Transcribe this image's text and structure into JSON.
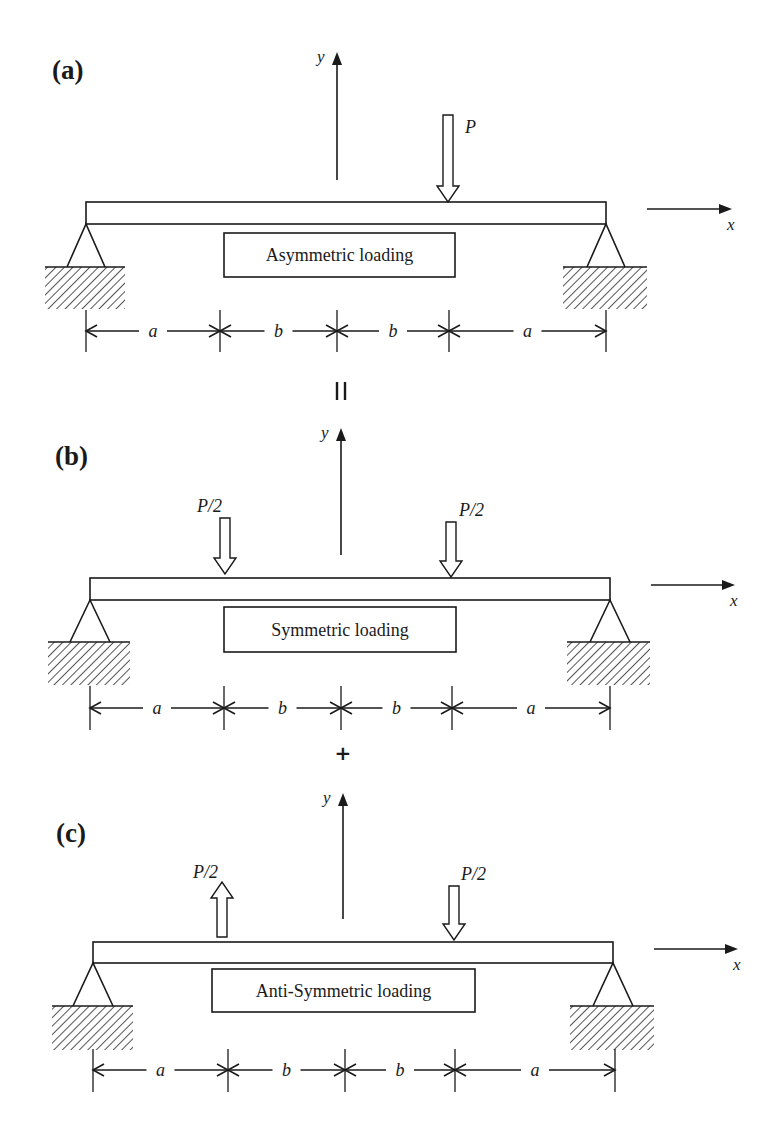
{
  "figure": {
    "width": 783,
    "height": 1136,
    "colors": {
      "ink": "#1a1a1a",
      "background": "#ffffff",
      "hatch": "#555555"
    }
  },
  "operators": [
    {
      "symbol": "=",
      "x": 341,
      "y": 392,
      "rotated": true
    },
    {
      "symbol": "+",
      "x": 343,
      "y": 760,
      "rotated": false
    }
  ],
  "panels": [
    {
      "id": "a",
      "label": "(a)",
      "label_pos": [
        52,
        79
      ],
      "title": "Asymmetric loading",
      "beam": {
        "x1": 86,
        "x2": 606,
        "top": 202,
        "bottom": 224
      },
      "title_box": {
        "x": 224,
        "y": 233,
        "w": 231,
        "h": 44
      },
      "y_axis": {
        "x": 337,
        "y_bottom": 180,
        "y_top": 52,
        "label": "y"
      },
      "x_axis": {
        "x1": 647,
        "x2": 732,
        "y": 209,
        "label": "x"
      },
      "supports": [
        {
          "apex_x": 86,
          "apex_y": 224,
          "base_y": 267,
          "half_w": 19,
          "hatch_x1": 45,
          "hatch_x2": 125,
          "hatch_h": 42
        },
        {
          "apex_x": 606,
          "apex_y": 224,
          "base_y": 267,
          "half_w": 19,
          "hatch_x1": 563,
          "hatch_x2": 647,
          "hatch_h": 42
        }
      ],
      "loads": [
        {
          "label": "P",
          "x": 448,
          "direction": "down",
          "tip_y": 202,
          "tail_y": 115,
          "label_dx": 17,
          "label_y": 133
        }
      ],
      "dimension": {
        "y": 331,
        "tick_top": 310,
        "tick_bottom": 352,
        "ticks": [
          86,
          220,
          337,
          449,
          606
        ],
        "segments": [
          "a",
          "b",
          "b",
          "a"
        ]
      }
    },
    {
      "id": "b",
      "label": "(b)",
      "label_pos": [
        55,
        465
      ],
      "title": "Symmetric loading",
      "beam": {
        "x1": 90,
        "x2": 610,
        "top": 578,
        "bottom": 600
      },
      "title_box": {
        "x": 224,
        "y": 607,
        "w": 232,
        "h": 45
      },
      "y_axis": {
        "x": 341,
        "y_bottom": 555,
        "y_top": 428,
        "label": "y"
      },
      "x_axis": {
        "x1": 651,
        "x2": 735,
        "y": 585,
        "label": "x"
      },
      "supports": [
        {
          "apex_x": 90,
          "apex_y": 600,
          "base_y": 642,
          "half_w": 20,
          "hatch_x1": 48,
          "hatch_x2": 130,
          "hatch_h": 43
        },
        {
          "apex_x": 610,
          "apex_y": 600,
          "base_y": 642,
          "half_w": 20,
          "hatch_x1": 567,
          "hatch_x2": 650,
          "hatch_h": 43
        }
      ],
      "loads": [
        {
          "label": "P/2",
          "x": 225,
          "direction": "down",
          "tip_y": 574,
          "tail_y": 518,
          "label_dx": -28,
          "label_y": 512
        },
        {
          "label": "P/2",
          "x": 451,
          "direction": "down",
          "tip_y": 577,
          "tail_y": 522,
          "label_dx": 8,
          "label_y": 516
        }
      ],
      "dimension": {
        "y": 708,
        "tick_top": 686,
        "tick_bottom": 730,
        "ticks": [
          90,
          224,
          341,
          452,
          610
        ],
        "segments": [
          "a",
          "b",
          "b",
          "a"
        ]
      }
    },
    {
      "id": "c",
      "label": "(c)",
      "label_pos": [
        56,
        842
      ],
      "title": "Anti-Symmetric loading",
      "beam": {
        "x1": 93,
        "x2": 613,
        "top": 942,
        "bottom": 963
      },
      "title_box": {
        "x": 212,
        "y": 969,
        "w": 263,
        "h": 43
      },
      "y_axis": {
        "x": 343,
        "y_bottom": 919,
        "y_top": 793,
        "label": "y"
      },
      "x_axis": {
        "x1": 654,
        "x2": 738,
        "y": 949,
        "label": "x"
      },
      "supports": [
        {
          "apex_x": 93,
          "apex_y": 963,
          "base_y": 1006,
          "half_w": 20,
          "hatch_x1": 52,
          "hatch_x2": 133,
          "hatch_h": 44
        },
        {
          "apex_x": 613,
          "apex_y": 963,
          "base_y": 1006,
          "half_w": 20,
          "hatch_x1": 570,
          "hatch_x2": 654,
          "hatch_h": 44
        }
      ],
      "loads": [
        {
          "label": "P/2",
          "x": 222,
          "direction": "up",
          "tip_y": 882,
          "tail_y": 937,
          "label_dx": -29,
          "label_y": 878
        },
        {
          "label": "P/2",
          "x": 454,
          "direction": "down",
          "tip_y": 940,
          "tail_y": 886,
          "label_dx": 7,
          "label_y": 880
        }
      ],
      "dimension": {
        "y": 1070,
        "tick_top": 1049,
        "tick_bottom": 1092,
        "ticks": [
          93,
          228,
          345,
          455,
          615
        ],
        "segments": [
          "a",
          "b",
          "b",
          "a"
        ]
      }
    }
  ]
}
